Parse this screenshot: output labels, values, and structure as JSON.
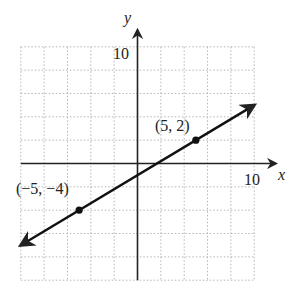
{
  "chart_data": {
    "type": "line",
    "title": "",
    "xlabel": "x",
    "ylabel": "y",
    "xlim": [
      -10,
      10
    ],
    "ylim": [
      -10,
      10
    ],
    "grid": true,
    "grid_step": 2,
    "tick_labels": {
      "x": "10",
      "y": "10"
    },
    "series": [
      {
        "name": "line through (-5,-4) and (5,2)",
        "equation": "y = 0.6x - 1",
        "x": [
          -5,
          5
        ],
        "y": [
          -4,
          2
        ]
      }
    ],
    "points": [
      {
        "x": -5,
        "y": -4,
        "label": "(−5, −4)"
      },
      {
        "x": 5,
        "y": 2,
        "label": "(5, 2)"
      }
    ]
  },
  "colors": {
    "axis": "#222222",
    "grid": "#b5b5b5",
    "line": "#111111"
  }
}
